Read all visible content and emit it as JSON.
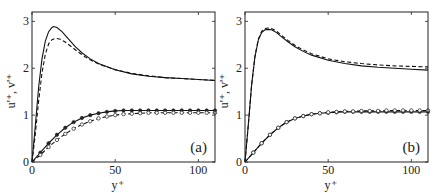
{
  "chart_data": [
    {
      "type": "line",
      "panel_tag": "(a)",
      "xlabel": "y⁺",
      "ylabel": "u'⁺, v'⁺",
      "xlim": [
        0,
        110
      ],
      "ylim": [
        0,
        3.2
      ],
      "xticks": [
        0,
        50,
        100
      ],
      "yticks": [
        0,
        1,
        2,
        3
      ],
      "xtick_labels": [
        "0",
        "50",
        "100"
      ],
      "ytick_labels": [
        "0",
        "1",
        "2",
        "3"
      ],
      "grid": false,
      "series": [
        {
          "name": "u'+ solid",
          "style": "solid",
          "marker": "none",
          "x": [
            0,
            2,
            4,
            6,
            8,
            10,
            12,
            13,
            15,
            18,
            22,
            26,
            30,
            35,
            40,
            50,
            60,
            70,
            80,
            90,
            100,
            110
          ],
          "y": [
            0,
            0.78,
            1.6,
            2.2,
            2.58,
            2.78,
            2.87,
            2.89,
            2.87,
            2.78,
            2.62,
            2.46,
            2.33,
            2.2,
            2.1,
            1.97,
            1.88,
            1.83,
            1.8,
            1.78,
            1.76,
            1.74
          ]
        },
        {
          "name": "u'+ dashed",
          "style": "dashed",
          "marker": "none",
          "x": [
            0,
            2,
            4,
            6,
            8,
            10,
            12,
            14.5,
            17,
            20,
            24,
            28,
            32,
            36,
            40,
            50,
            60,
            70,
            80,
            90,
            100,
            110
          ],
          "y": [
            0,
            0.6,
            1.3,
            1.9,
            2.3,
            2.52,
            2.61,
            2.64,
            2.62,
            2.56,
            2.45,
            2.34,
            2.24,
            2.16,
            2.09,
            1.97,
            1.89,
            1.84,
            1.8,
            1.78,
            1.76,
            1.74
          ]
        },
        {
          "name": "v'+ solid",
          "style": "solid",
          "marker": "filled",
          "x": [
            0,
            5,
            10,
            15,
            20,
            25,
            30,
            35,
            40,
            45,
            50,
            55,
            60,
            65,
            70,
            75,
            80,
            85,
            90,
            95,
            100,
            105,
            110
          ],
          "y": [
            0,
            0.2,
            0.4,
            0.58,
            0.73,
            0.85,
            0.94,
            1.0,
            1.04,
            1.07,
            1.09,
            1.1,
            1.1,
            1.1,
            1.1,
            1.1,
            1.1,
            1.1,
            1.1,
            1.1,
            1.1,
            1.1,
            1.1
          ]
        },
        {
          "name": "v'+ dashed",
          "style": "dashed",
          "marker": "open",
          "x": [
            0,
            5,
            10,
            15,
            20,
            25,
            30,
            35,
            40,
            45,
            50,
            55,
            60,
            65,
            70,
            75,
            80,
            85,
            90,
            95,
            100,
            105,
            110
          ],
          "y": [
            0,
            0.15,
            0.32,
            0.47,
            0.6,
            0.71,
            0.8,
            0.87,
            0.93,
            0.97,
            1.0,
            1.02,
            1.03,
            1.04,
            1.05,
            1.05,
            1.05,
            1.05,
            1.05,
            1.05,
            1.05,
            1.05,
            1.05
          ]
        }
      ]
    },
    {
      "type": "line",
      "panel_tag": "(b)",
      "xlabel": "y⁺",
      "ylabel": "u'⁺, v'⁺",
      "xlim": [
        0,
        110
      ],
      "ylim": [
        0,
        3.2
      ],
      "xticks": [
        0,
        50,
        100
      ],
      "yticks": [
        0,
        1,
        2,
        3
      ],
      "xtick_labels": [
        "0",
        "50",
        "100"
      ],
      "ytick_labels": [
        "0",
        "1",
        "2",
        "3"
      ],
      "grid": false,
      "series": [
        {
          "name": "u'+ solid",
          "style": "solid",
          "marker": "none",
          "x": [
            0,
            2,
            4,
            6,
            8,
            10,
            12,
            14,
            16,
            19,
            22,
            26,
            30,
            35,
            40,
            50,
            60,
            70,
            80,
            90,
            100,
            110
          ],
          "y": [
            0,
            0.8,
            1.65,
            2.25,
            2.6,
            2.76,
            2.82,
            2.83,
            2.82,
            2.76,
            2.67,
            2.56,
            2.46,
            2.36,
            2.28,
            2.17,
            2.1,
            2.05,
            2.02,
            2.0,
            1.98,
            1.96
          ]
        },
        {
          "name": "u'+ dashed",
          "style": "dashed",
          "marker": "none",
          "x": [
            0,
            2,
            4,
            6,
            8,
            10,
            12,
            14,
            16,
            19,
            22,
            26,
            30,
            35,
            40,
            50,
            60,
            70,
            80,
            90,
            100,
            110
          ],
          "y": [
            0,
            0.8,
            1.65,
            2.26,
            2.62,
            2.79,
            2.85,
            2.86,
            2.85,
            2.79,
            2.7,
            2.59,
            2.49,
            2.39,
            2.31,
            2.2,
            2.14,
            2.1,
            2.07,
            2.05,
            2.04,
            2.03
          ]
        },
        {
          "name": "v'+ solid",
          "style": "solid",
          "marker": "filled",
          "x": [
            0,
            5,
            10,
            15,
            20,
            25,
            30,
            35,
            40,
            45,
            50,
            55,
            60,
            65,
            70,
            75,
            80,
            85,
            90,
            95,
            100,
            105,
            110
          ],
          "y": [
            0,
            0.2,
            0.4,
            0.58,
            0.73,
            0.85,
            0.93,
            0.98,
            1.02,
            1.04,
            1.05,
            1.06,
            1.07,
            1.07,
            1.07,
            1.07,
            1.07,
            1.07,
            1.07,
            1.07,
            1.07,
            1.07,
            1.07
          ]
        },
        {
          "name": "v'+ dashed",
          "style": "dashed",
          "marker": "open",
          "x": [
            0,
            5,
            10,
            15,
            20,
            25,
            30,
            35,
            40,
            45,
            50,
            55,
            60,
            65,
            70,
            75,
            80,
            85,
            90,
            95,
            100,
            105,
            110
          ],
          "y": [
            0,
            0.2,
            0.4,
            0.58,
            0.73,
            0.85,
            0.93,
            0.98,
            1.02,
            1.04,
            1.06,
            1.07,
            1.08,
            1.08,
            1.09,
            1.09,
            1.09,
            1.1,
            1.1,
            1.1,
            1.1,
            1.1,
            1.1
          ]
        }
      ]
    }
  ]
}
